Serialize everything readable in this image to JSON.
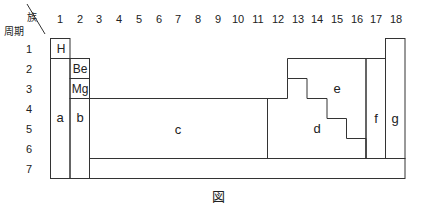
{
  "header": {
    "group_label": "族",
    "period_label": "周期"
  },
  "groups": [
    "1",
    "2",
    "3",
    "4",
    "5",
    "6",
    "7",
    "8",
    "9",
    "10",
    "11",
    "12",
    "13",
    "14",
    "15",
    "16",
    "17",
    "18"
  ],
  "periods": [
    "1",
    "2",
    "3",
    "4",
    "5",
    "6",
    "7"
  ],
  "elements": {
    "h": "H",
    "be": "Be",
    "mg": "Mg"
  },
  "regions": {
    "a": "a",
    "b": "b",
    "c": "c",
    "d": "d",
    "e": "e",
    "f": "f",
    "g": "g"
  },
  "caption": "図"
}
